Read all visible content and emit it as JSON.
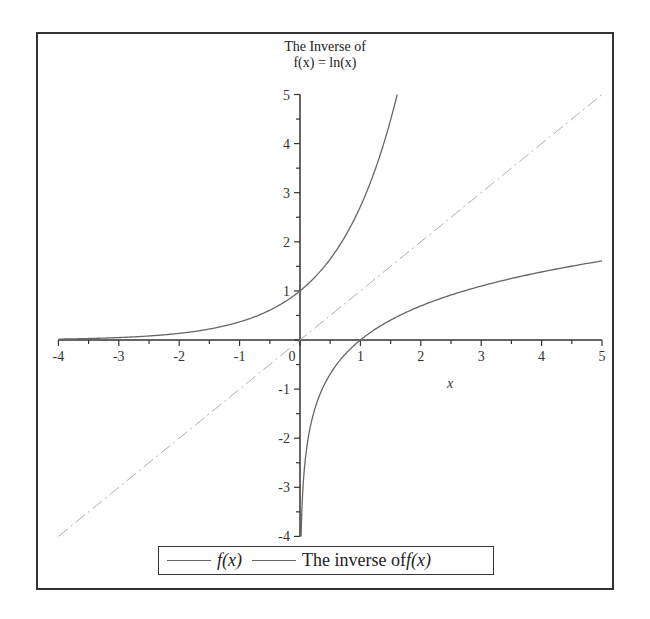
{
  "chart_data": {
    "type": "line",
    "title_lines": [
      "The Inverse of",
      "f(x) = ln(x)"
    ],
    "xlabel": "x",
    "ylabel": "",
    "xlim": [
      -4,
      5
    ],
    "ylim": [
      -4,
      5
    ],
    "x_ticks": [
      "-4",
      "-3",
      "-2",
      "-1",
      "0",
      "1",
      "2",
      "3",
      "4",
      "5"
    ],
    "y_ticks": [
      "5",
      "4",
      "3",
      "2",
      "1",
      "-1",
      "-2",
      "-3",
      "-4"
    ],
    "grid": false,
    "legend_position": "bottom",
    "series": [
      {
        "name": "f(x)",
        "expression": "e^x",
        "color": "#666666",
        "style": "solid",
        "x": [
          -4,
          -3,
          -2,
          -1,
          0,
          0.5,
          1,
          1.5,
          1.609
        ],
        "y": [
          0.018,
          0.05,
          0.135,
          0.368,
          1,
          1.649,
          2.718,
          4.482,
          5
        ]
      },
      {
        "name": "The inverse of f(x)",
        "expression": "ln(x)",
        "color": "#666666",
        "style": "solid",
        "x": [
          0.018,
          0.05,
          0.135,
          0.368,
          1,
          2,
          3,
          4,
          5
        ],
        "y": [
          -4,
          -3,
          -2,
          -1,
          0,
          0.693,
          1.099,
          1.386,
          1.609
        ]
      },
      {
        "name": "y = x",
        "expression": "x",
        "color": "#aaaaaa",
        "style": "dashdot",
        "x": [
          -4,
          5
        ],
        "y": [
          -4,
          5
        ]
      }
    ]
  },
  "legend": {
    "item1_label": "f(x)",
    "item2_prefix": "The inverse of ",
    "item2_fx": "f(x)"
  }
}
